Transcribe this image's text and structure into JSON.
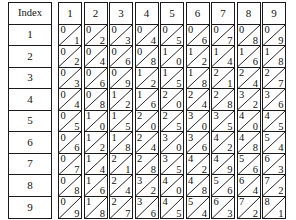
{
  "table": {
    "index_header": "Index",
    "index_labels": [
      "1",
      "2",
      "3",
      "4",
      "5",
      "6",
      "7",
      "8",
      "9"
    ],
    "column_headers": [
      "1",
      "2",
      "3",
      "4",
      "5",
      "6",
      "7",
      "8",
      "9"
    ],
    "cell_style": "diagonal-split",
    "diagonal_direction": "bottom-left-to-top-right",
    "tens_position": "upper-left",
    "ones_position": "lower-right",
    "border_color": "#1a1a1a",
    "text_color": "#111111",
    "background_color": "#ffffff"
  },
  "chart_data": {
    "type": "table",
    "title": "",
    "xlabel": "",
    "ylabel": "",
    "row_header_label": "Index",
    "rows": [
      "1",
      "2",
      "3",
      "4",
      "5",
      "6",
      "7",
      "8",
      "9"
    ],
    "categories": [
      "1",
      "2",
      "3",
      "4",
      "5",
      "6",
      "7",
      "8",
      "9"
    ],
    "products": [
      [
        1,
        2,
        3,
        4,
        5,
        6,
        7,
        8,
        9
      ],
      [
        2,
        4,
        6,
        8,
        10,
        12,
        14,
        16,
        18
      ],
      [
        3,
        6,
        9,
        12,
        15,
        18,
        21,
        24,
        27
      ],
      [
        4,
        8,
        12,
        16,
        20,
        24,
        28,
        32,
        36
      ],
      [
        5,
        10,
        15,
        20,
        25,
        30,
        35,
        40,
        45
      ],
      [
        6,
        12,
        18,
        24,
        30,
        36,
        42,
        48,
        54
      ],
      [
        7,
        14,
        21,
        28,
        35,
        42,
        49,
        56,
        63
      ],
      [
        8,
        16,
        24,
        32,
        40,
        48,
        56,
        64,
        72
      ],
      [
        9,
        18,
        27,
        36,
        45,
        54,
        63,
        72,
        81
      ]
    ],
    "cells": [
      [
        {
          "tens": "0",
          "ones": "1"
        },
        {
          "tens": "0",
          "ones": "2"
        },
        {
          "tens": "0",
          "ones": "3"
        },
        {
          "tens": "0",
          "ones": "4"
        },
        {
          "tens": "0",
          "ones": "5"
        },
        {
          "tens": "0",
          "ones": "6"
        },
        {
          "tens": "0",
          "ones": "7"
        },
        {
          "tens": "0",
          "ones": "8"
        },
        {
          "tens": "0",
          "ones": "9"
        }
      ],
      [
        {
          "tens": "0",
          "ones": "2"
        },
        {
          "tens": "0",
          "ones": "4"
        },
        {
          "tens": "0",
          "ones": "6"
        },
        {
          "tens": "0",
          "ones": "8"
        },
        {
          "tens": "1",
          "ones": "0"
        },
        {
          "tens": "1",
          "ones": "2"
        },
        {
          "tens": "1",
          "ones": "4"
        },
        {
          "tens": "1",
          "ones": "6"
        },
        {
          "tens": "1",
          "ones": "8"
        }
      ],
      [
        {
          "tens": "0",
          "ones": "3"
        },
        {
          "tens": "0",
          "ones": "6"
        },
        {
          "tens": "0",
          "ones": "9"
        },
        {
          "tens": "1",
          "ones": "2"
        },
        {
          "tens": "1",
          "ones": "5"
        },
        {
          "tens": "1",
          "ones": "8"
        },
        {
          "tens": "2",
          "ones": "1"
        },
        {
          "tens": "2",
          "ones": "4"
        },
        {
          "tens": "2",
          "ones": "7"
        }
      ],
      [
        {
          "tens": "0",
          "ones": "4"
        },
        {
          "tens": "0",
          "ones": "8"
        },
        {
          "tens": "1",
          "ones": "2"
        },
        {
          "tens": "1",
          "ones": "6"
        },
        {
          "tens": "2",
          "ones": "0"
        },
        {
          "tens": "2",
          "ones": "4"
        },
        {
          "tens": "2",
          "ones": "8"
        },
        {
          "tens": "3",
          "ones": "2"
        },
        {
          "tens": "3",
          "ones": "6"
        }
      ],
      [
        {
          "tens": "0",
          "ones": "5"
        },
        {
          "tens": "1",
          "ones": "0"
        },
        {
          "tens": "1",
          "ones": "5"
        },
        {
          "tens": "2",
          "ones": "0"
        },
        {
          "tens": "2",
          "ones": "5"
        },
        {
          "tens": "3",
          "ones": "0"
        },
        {
          "tens": "3",
          "ones": "5"
        },
        {
          "tens": "4",
          "ones": "0"
        },
        {
          "tens": "4",
          "ones": "5"
        }
      ],
      [
        {
          "tens": "0",
          "ones": "6"
        },
        {
          "tens": "1",
          "ones": "2"
        },
        {
          "tens": "1",
          "ones": "8"
        },
        {
          "tens": "2",
          "ones": "4"
        },
        {
          "tens": "3",
          "ones": "0"
        },
        {
          "tens": "3",
          "ones": "6"
        },
        {
          "tens": "4",
          "ones": "2"
        },
        {
          "tens": "4",
          "ones": "8"
        },
        {
          "tens": "5",
          "ones": "4"
        }
      ],
      [
        {
          "tens": "0",
          "ones": "7"
        },
        {
          "tens": "1",
          "ones": "4"
        },
        {
          "tens": "2",
          "ones": "1"
        },
        {
          "tens": "2",
          "ones": "8"
        },
        {
          "tens": "3",
          "ones": "5"
        },
        {
          "tens": "4",
          "ones": "2"
        },
        {
          "tens": "4",
          "ones": "9"
        },
        {
          "tens": "5",
          "ones": "6"
        },
        {
          "tens": "6",
          "ones": "3"
        }
      ],
      [
        {
          "tens": "0",
          "ones": "8"
        },
        {
          "tens": "1",
          "ones": "6"
        },
        {
          "tens": "2",
          "ones": "4"
        },
        {
          "tens": "3",
          "ones": "2"
        },
        {
          "tens": "4",
          "ones": "0"
        },
        {
          "tens": "4",
          "ones": "8"
        },
        {
          "tens": "5",
          "ones": "6"
        },
        {
          "tens": "6",
          "ones": "4"
        },
        {
          "tens": "7",
          "ones": "2"
        }
      ],
      [
        {
          "tens": "0",
          "ones": "9"
        },
        {
          "tens": "1",
          "ones": "8"
        },
        {
          "tens": "2",
          "ones": "7"
        },
        {
          "tens": "3",
          "ones": "6"
        },
        {
          "tens": "4",
          "ones": "5"
        },
        {
          "tens": "5",
          "ones": "4"
        },
        {
          "tens": "6",
          "ones": "3"
        },
        {
          "tens": "7",
          "ones": "2"
        },
        {
          "tens": "8",
          "ones": "1"
        }
      ]
    ]
  }
}
